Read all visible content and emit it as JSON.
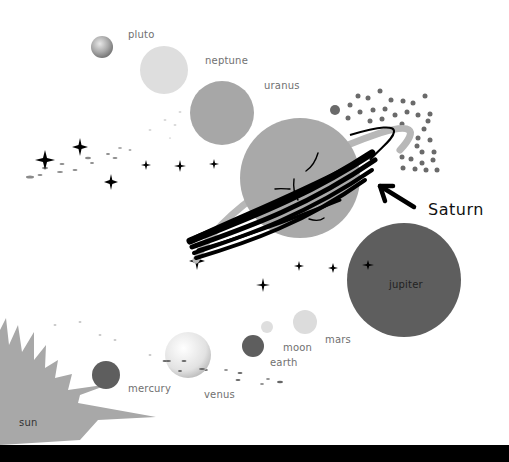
{
  "diagram": {
    "callout": "Saturn",
    "colors": {
      "background": "#ffffff",
      "dark_planet": "#5e5e5e",
      "mid_planet": "#a3a3a3",
      "light_planet": "#dcdcdc",
      "sun": "#a8a8a8",
      "ink": "#000000"
    },
    "bodies": [
      {
        "name": "pluto",
        "label": "pluto"
      },
      {
        "name": "neptune",
        "label": "neptune"
      },
      {
        "name": "uranus",
        "label": "uranus"
      },
      {
        "name": "saturn",
        "label": "Saturn"
      },
      {
        "name": "jupiter",
        "label": "jupiter"
      },
      {
        "name": "mars",
        "label": "mars"
      },
      {
        "name": "moon",
        "label": "moon"
      },
      {
        "name": "earth",
        "label": "earth"
      },
      {
        "name": "venus",
        "label": "venus"
      },
      {
        "name": "mercury",
        "label": "mercury"
      },
      {
        "name": "sun",
        "label": "sun"
      }
    ]
  }
}
